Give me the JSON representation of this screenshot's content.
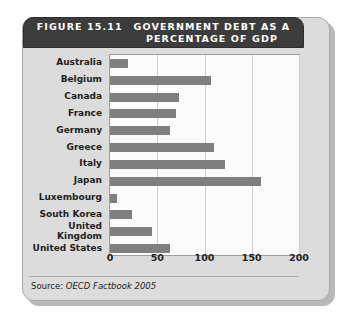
{
  "figure": {
    "number_label": "FIGURE 15.11",
    "title": "GOVERNMENT DEBT AS A\nPERCENTAGE OF GDP",
    "source_label": "Source:",
    "source_reference": "OECD Factbook 2005",
    "banner_color": "#3c3c3c",
    "card_color": "#dcdcdc",
    "bar_color": "#7f7f7f",
    "plot_background": "#fbfbfb",
    "gridline_color": "#cfcfcf"
  },
  "chart_data": {
    "type": "bar",
    "orientation": "horizontal",
    "title": "GOVERNMENT DEBT AS A PERCENTAGE OF GDP",
    "xlabel": "",
    "ylabel": "",
    "xlim": [
      0,
      200
    ],
    "xticks": [
      0,
      50,
      100,
      150,
      200
    ],
    "xtick_labels": [
      "0",
      "50",
      "100",
      "150",
      "200"
    ],
    "grid": true,
    "grid_axis": "x",
    "legend": false,
    "categories": [
      "Australia",
      "Belgium",
      "Canada",
      "France",
      "Germany",
      "Greece",
      "Italy",
      "Japan",
      "Luxembourg",
      "South Korea",
      "United\nKingdom",
      "United States"
    ],
    "values": [
      19,
      107,
      73,
      70,
      64,
      110,
      122,
      160,
      7,
      23,
      44,
      63
    ],
    "units": "percent of GDP"
  }
}
